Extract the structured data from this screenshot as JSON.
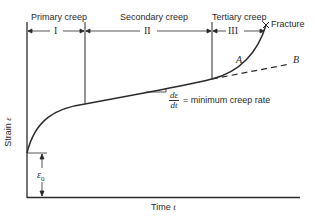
{
  "diagram": {
    "type": "creep-curve",
    "stages": [
      {
        "name": "Primary creep",
        "numeral": "I"
      },
      {
        "name": "Secondary creep",
        "numeral": "II"
      },
      {
        "name": "Tertiary creep",
        "numeral": "III"
      }
    ],
    "fracture_label": "Fracture",
    "curve_labels": {
      "a": "A",
      "b": "B"
    },
    "slope_annotation": {
      "numerator": "dε",
      "denominator": "dt",
      "text": "= minimum creep rate"
    },
    "initial_strain_label": "ε0",
    "initial_strain_symbol": "ε",
    "initial_strain_sub": "0",
    "axes": {
      "y_label": "Strain",
      "y_symbol": "ε",
      "x_label": "Time",
      "x_symbol": "t"
    },
    "colors": {
      "line": "#2a2a2a",
      "background": "#ffffff"
    }
  }
}
